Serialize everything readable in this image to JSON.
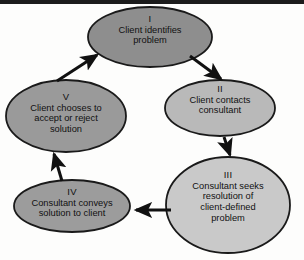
{
  "figure": {
    "type": "cycle-flow-diagram",
    "orientation": "clockwise",
    "node_count": 5,
    "background_color": "#fdfdfc",
    "outline_color": "#1a1a1a",
    "arrow_color": "#111111",
    "top_bar_color": "#1c1c1c"
  },
  "nodes": [
    {
      "id": "node-1",
      "roman": "I",
      "text": "Client identifies problem",
      "lines": [
        "Client identifies",
        "problem"
      ],
      "fill": "#8e8e8e",
      "cx": 150,
      "cy": 37,
      "rx": 62,
      "ry": 30
    },
    {
      "id": "node-2",
      "roman": "II",
      "text": "Client contacts consultant",
      "lines": [
        "Client contacts",
        "consultant"
      ],
      "fill": "#b9b9b9",
      "cx": 220,
      "cy": 108,
      "rx": 55,
      "ry": 28
    },
    {
      "id": "node-3",
      "roman": "III",
      "text": "Consultant seeks resolution of client-defined problem",
      "lines": [
        "Consultant seeks",
        "resolution of",
        "client-defined",
        "problem"
      ],
      "fill": "#c9c9c9",
      "cx": 228,
      "cy": 205,
      "rx": 62,
      "ry": 48
    },
    {
      "id": "node-4",
      "roman": "IV",
      "text": "Consultant conveys solution to client",
      "lines": [
        "Consultant conveys",
        "solution to client"
      ],
      "fill": "#9c9c9c",
      "cx": 72,
      "cy": 206,
      "rx": 58,
      "ry": 26
    },
    {
      "id": "node-5",
      "roman": "V",
      "text": "Client chooses to accept or reject solution",
      "lines": [
        "Client chooses to",
        "accept or reject",
        "solution"
      ],
      "fill": "#9a9a9a",
      "cx": 66,
      "cy": 116,
      "rx": 60,
      "ry": 36
    }
  ],
  "arrows": [
    {
      "id": "arrow-5-to-1",
      "from": "node-5",
      "to": "node-1",
      "direction": "up-right"
    },
    {
      "id": "arrow-1-to-2",
      "from": "node-1",
      "to": "node-2",
      "direction": "down-right"
    },
    {
      "id": "arrow-2-to-3",
      "from": "node-2",
      "to": "node-3",
      "direction": "down"
    },
    {
      "id": "arrow-3-to-4",
      "from": "node-3",
      "to": "node-4",
      "direction": "left"
    },
    {
      "id": "arrow-4-to-5",
      "from": "node-4",
      "to": "node-5",
      "direction": "up"
    }
  ]
}
